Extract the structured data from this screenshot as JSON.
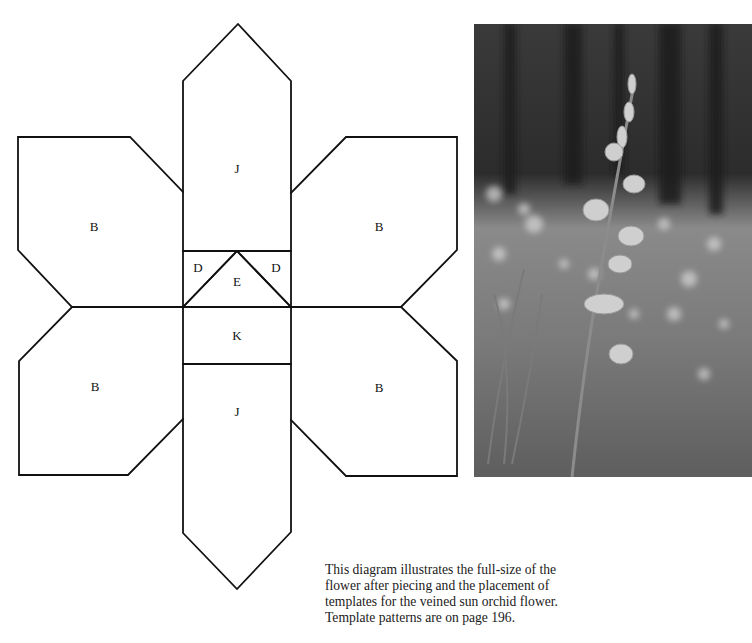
{
  "diagram": {
    "labels": {
      "top_petal": "J",
      "bottom_petal": "J",
      "upper_left_petal": "B",
      "upper_right_petal": "B",
      "lower_left_petal": "B",
      "lower_right_petal": "B",
      "left_triangle": "D",
      "right_triangle": "D",
      "center_triangle": "E",
      "center_rectangle": "K"
    },
    "stroke_color": "#111111"
  },
  "photo": {
    "subject": "veined sun orchid flower stem in a grassy woodland clearing",
    "style": "black-and-white photograph"
  },
  "caption": {
    "text": "This diagram illustrates the full-size of the flower after piecing and the placement of templates for the veined sun orchid flower. Template patterns are on page 196."
  }
}
